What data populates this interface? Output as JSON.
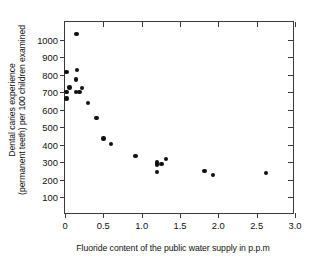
{
  "chart_data": {
    "type": "scatter",
    "title": "",
    "xlabel": "Fluoride content of the public water supply in p.p.m",
    "ylabel_line1": "Dental caries experience",
    "ylabel_line2": "(permanent teeth) per 100 children examined",
    "xlim": [
      0,
      3.0
    ],
    "ylim": [
      0,
      1100
    ],
    "xticks": [
      "0",
      "0.5",
      "1.0",
      "1.5",
      "2.0",
      "2.5",
      "3.0"
    ],
    "xtick_values": [
      0,
      0.5,
      1.0,
      1.5,
      2.0,
      2.5,
      3.0
    ],
    "yticks": [
      "100",
      "200",
      "300",
      "400",
      "500",
      "600",
      "700",
      "800",
      "900",
      "1000"
    ],
    "ytick_values": [
      100,
      200,
      300,
      400,
      500,
      600,
      700,
      800,
      900,
      1000
    ],
    "grid": false,
    "legend": null,
    "marker": "filled-circle",
    "marker_color": "#111111",
    "points": [
      {
        "x": 0.15,
        "y": 1030
      },
      {
        "x": 0.02,
        "y": 815
      },
      {
        "x": 0.16,
        "y": 825
      },
      {
        "x": 0.14,
        "y": 772
      },
      {
        "x": 0.06,
        "y": 727
      },
      {
        "x": 0.22,
        "y": 725
      },
      {
        "x": 0.02,
        "y": 700
      },
      {
        "x": 0.14,
        "y": 700
      },
      {
        "x": 0.19,
        "y": 702
      },
      {
        "x": 0.02,
        "y": 663
      },
      {
        "x": 0.3,
        "y": 640
      },
      {
        "x": 0.41,
        "y": 552
      },
      {
        "x": 0.5,
        "y": 435
      },
      {
        "x": 0.6,
        "y": 403
      },
      {
        "x": 0.92,
        "y": 335
      },
      {
        "x": 1.2,
        "y": 300
      },
      {
        "x": 1.2,
        "y": 287
      },
      {
        "x": 1.26,
        "y": 292
      },
      {
        "x": 1.2,
        "y": 245
      },
      {
        "x": 1.32,
        "y": 320
      },
      {
        "x": 1.82,
        "y": 250
      },
      {
        "x": 1.93,
        "y": 228
      },
      {
        "x": 2.62,
        "y": 240
      }
    ]
  },
  "axis": {
    "x_title": "Fluoride content of the public water supply in p.p.m",
    "y_title_line1": "Dental caries experience",
    "y_title_line2": "(permanent teeth) per 100 children examined"
  }
}
